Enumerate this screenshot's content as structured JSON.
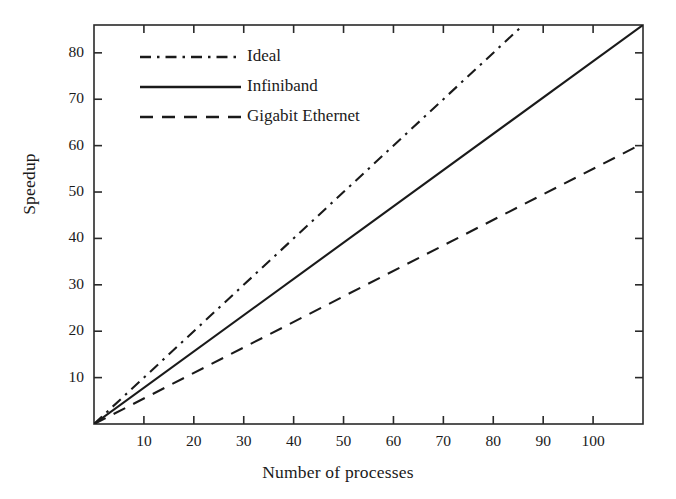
{
  "chart_data": {
    "type": "line",
    "title": "",
    "xlabel": "Number of processes",
    "ylabel": "Speedup",
    "xlim": [
      0,
      110
    ],
    "ylim": [
      0,
      86
    ],
    "xticks": [
      10,
      20,
      30,
      40,
      50,
      60,
      70,
      80,
      90,
      100
    ],
    "yticks": [
      10,
      20,
      30,
      40,
      50,
      60,
      70,
      80
    ],
    "xtick_labels": [
      "10",
      "20",
      "30",
      "40",
      "50",
      "60",
      "70",
      "80",
      "90",
      "100"
    ],
    "ytick_labels": [
      "10",
      "20",
      "30",
      "40",
      "50",
      "60",
      "70",
      "80"
    ],
    "grid": false,
    "legend_position": "upper-left-inside",
    "series": [
      {
        "name": "Ideal",
        "linestyle": "dashdot",
        "color": "#1a1a1a",
        "x": [
          0,
          86
        ],
        "values": [
          0,
          86
        ]
      },
      {
        "name": "Infiniband",
        "linestyle": "solid",
        "color": "#1a1a1a",
        "x": [
          0,
          110
        ],
        "values": [
          0,
          86
        ]
      },
      {
        "name": "Gigabit Ethernet",
        "linestyle": "dashed",
        "color": "#1a1a1a",
        "x": [
          0,
          110
        ],
        "values": [
          0,
          60.5
        ]
      }
    ]
  },
  "legend": {
    "entries": [
      {
        "label": "Ideal",
        "style": "dashdot"
      },
      {
        "label": "Infiniband",
        "style": "solid"
      },
      {
        "label": "Gigabit Ethernet",
        "style": "dashed"
      }
    ]
  },
  "axes": {
    "x_title": "Number of processes",
    "y_title": "Speedup"
  }
}
